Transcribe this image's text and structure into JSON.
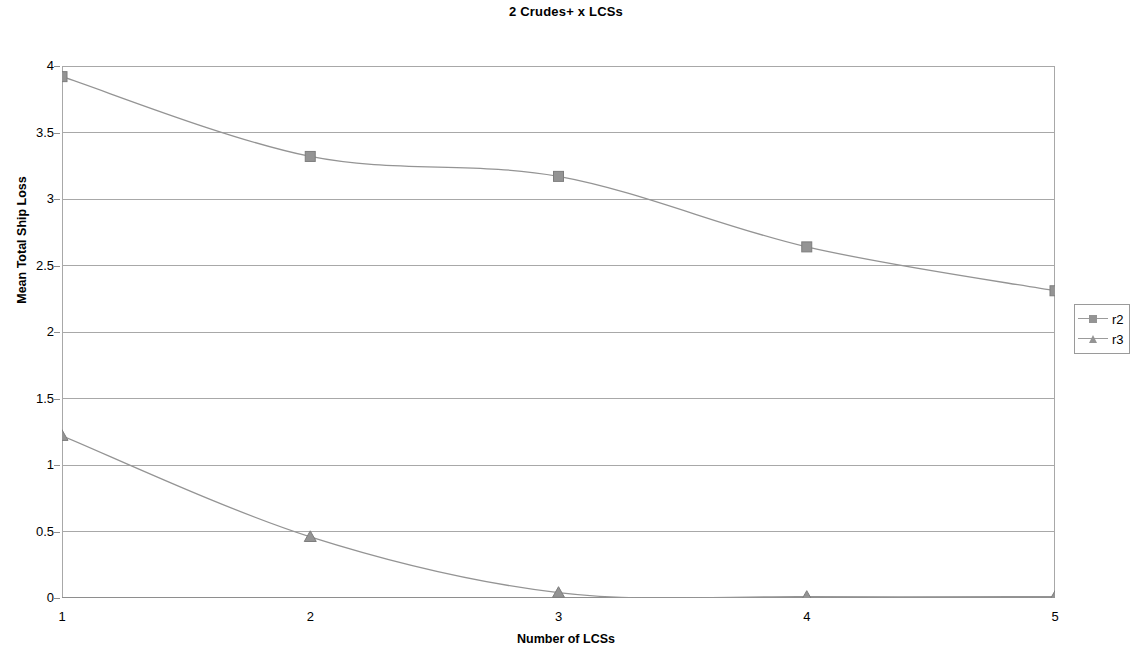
{
  "chart_data": {
    "type": "line",
    "title": "2 Crudes+ x LCSs",
    "xlabel": "Number of LCSs",
    "ylabel": "Mean Total Ship Loss",
    "x": [
      1,
      2,
      3,
      4,
      5
    ],
    "xlim": [
      1,
      5
    ],
    "ylim": [
      0,
      4
    ],
    "x_ticks": [
      "1",
      "2",
      "3",
      "4",
      "5"
    ],
    "y_ticks": [
      "0",
      "0.5",
      "1",
      "1.5",
      "2",
      "2.5",
      "3",
      "3.5",
      "4"
    ],
    "grid": "horizontal",
    "legend_position": "right",
    "series": [
      {
        "name": "r2",
        "marker": "square",
        "color": "#949494",
        "values": [
          3.92,
          3.32,
          3.17,
          2.64,
          2.31
        ]
      },
      {
        "name": "r3",
        "marker": "triangle",
        "color": "#949494",
        "values": [
          1.22,
          0.46,
          0.04,
          0.01,
          0.01
        ]
      }
    ]
  },
  "legend": {
    "items": [
      {
        "label": "r2",
        "marker": "square-marker-icon"
      },
      {
        "label": "r3",
        "marker": "triangle-marker-icon"
      }
    ]
  }
}
